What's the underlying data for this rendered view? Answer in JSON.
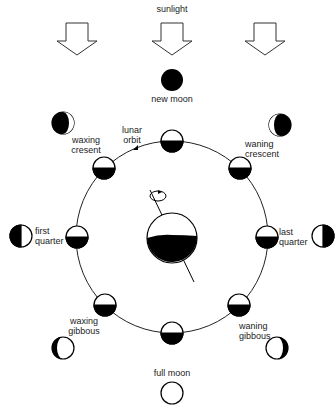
{
  "title": "sunlight",
  "labels": {
    "new_moon": "new moon",
    "full_moon": "full moon",
    "waxing_crescent_1": "waxing",
    "waxing_crescent_2": "cresent",
    "waning_crescent_1": "waning",
    "waning_crescent_2": "crescent",
    "first_quarter_1": "first",
    "first_quarter_2": "quarter",
    "last_quarter_1": "last",
    "last_quarter_2": "quarter",
    "waxing_gibbous_1": "waxing",
    "waxing_gibbous_2": "gibbous",
    "waning_gibbous_1": "waning",
    "waning_gibbous_2": "gibbous",
    "lunar_orbit_1": "lunar",
    "lunar_orbit_2": "orbit"
  },
  "colors": {
    "ink": "#000000",
    "background": "#ffffff"
  }
}
